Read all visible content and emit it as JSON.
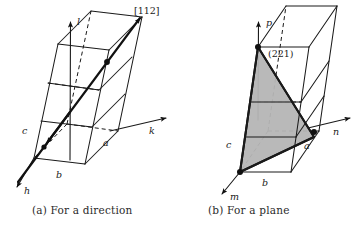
{
  "figure": {
    "background_color": "#ffffff",
    "ink_color": "#1a1a1a",
    "plane_shade_color": "#b5b5b5"
  },
  "panels": [
    {
      "id": "a",
      "caption": "(a) For a direction",
      "axes": [
        {
          "name": "h",
          "label": "h"
        },
        {
          "name": "k",
          "label": "k"
        },
        {
          "name": "l",
          "label": "l"
        }
      ],
      "cell_edges": [
        {
          "name": "a",
          "label": "a"
        },
        {
          "name": "b",
          "label": "b"
        },
        {
          "name": "c",
          "label": "c"
        }
      ],
      "annotation": "[112]",
      "annotation_kind": "direction-index"
    },
    {
      "id": "b",
      "caption": "(b) For a plane",
      "axes": [
        {
          "name": "m",
          "label": "m"
        },
        {
          "name": "n",
          "label": "n"
        },
        {
          "name": "p",
          "label": "p"
        }
      ],
      "cell_edges": [
        {
          "name": "a",
          "label": "a"
        },
        {
          "name": "b",
          "label": "b"
        },
        {
          "name": "c",
          "label": "c"
        }
      ],
      "annotation": "(221)",
      "annotation_kind": "plane-index"
    }
  ],
  "captions": {
    "a": "(a) For a direction",
    "b": "(b) For a plane"
  }
}
